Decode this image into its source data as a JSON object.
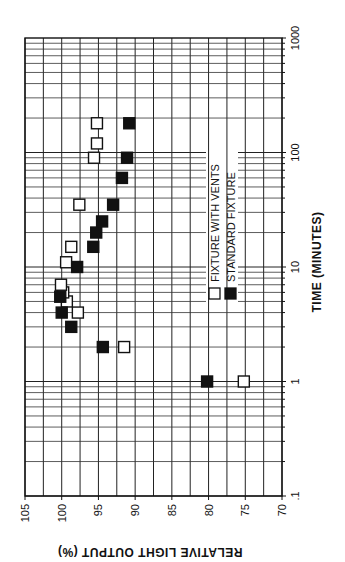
{
  "chart_data": {
    "type": "scatter",
    "title": "",
    "orientation_note": "figure rotated 90 degrees on page",
    "xlabel": "TIME (MINUTES)",
    "ylabel": "RELATIVE LIGHT OUTPUT (%)",
    "x_scale": "log",
    "xlim": [
      0.1,
      1000
    ],
    "ylim": [
      70,
      105
    ],
    "x_ticks": [
      ".1",
      "1",
      "10",
      "100",
      "1000"
    ],
    "y_ticks": [
      "105",
      "100",
      "95",
      "90",
      "85",
      "80",
      "75",
      "70"
    ],
    "grid": true,
    "legend_position": "inside, right side (rotated)",
    "series": [
      {
        "name": "FIXTURE WITH VENTS",
        "marker": "open-square",
        "color": "#ffffff",
        "points": [
          {
            "x": 1,
            "y": 75.2
          },
          {
            "x": 2,
            "y": 91.5
          },
          {
            "x": 4,
            "y": 97.8
          },
          {
            "x": 5,
            "y": 99.3
          },
          {
            "x": 6,
            "y": 99.8
          },
          {
            "x": 7,
            "y": 100.1
          },
          {
            "x": 11,
            "y": 99.4
          },
          {
            "x": 15,
            "y": 98.7
          },
          {
            "x": 35,
            "y": 97.6
          },
          {
            "x": 90,
            "y": 95.6
          },
          {
            "x": 120,
            "y": 95.2
          },
          {
            "x": 180,
            "y": 95.2
          }
        ]
      },
      {
        "name": "STANDARD FIXTURE",
        "marker": "filled-square",
        "color": "#111111",
        "points": [
          {
            "x": 1,
            "y": 80.2
          },
          {
            "x": 2,
            "y": 94.4
          },
          {
            "x": 3,
            "y": 98.7
          },
          {
            "x": 4,
            "y": 100.0
          },
          {
            "x": 5.5,
            "y": 100.2
          },
          {
            "x": 10,
            "y": 97.9
          },
          {
            "x": 15,
            "y": 95.7
          },
          {
            "x": 20,
            "y": 95.3
          },
          {
            "x": 25,
            "y": 94.5
          },
          {
            "x": 35,
            "y": 93.0
          },
          {
            "x": 60,
            "y": 91.8
          },
          {
            "x": 90,
            "y": 91.1
          },
          {
            "x": 180,
            "y": 90.8
          }
        ]
      }
    ]
  }
}
